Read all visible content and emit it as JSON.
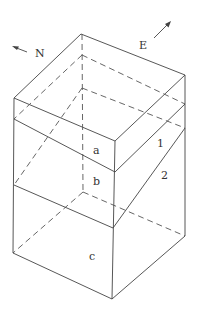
{
  "figure": {
    "compass": {
      "north_label": "N",
      "east_label": "E"
    },
    "layer_labels": {
      "a": "a",
      "b": "b",
      "c": "c"
    },
    "surface_labels": {
      "one": "1",
      "two": "2"
    },
    "colors": {
      "line": "#444444",
      "background": "#ffffff"
    }
  }
}
